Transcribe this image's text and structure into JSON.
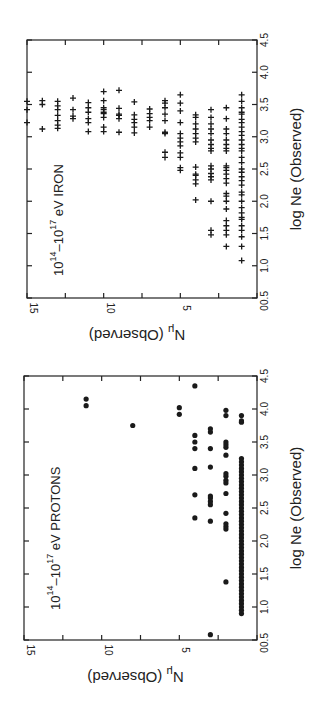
{
  "chart_data": [
    {
      "type": "scatter",
      "panel": "top",
      "title": "10^14 - 10^17 eV IRON",
      "title_parts": {
        "base1": "10",
        "exp1": "14",
        "dash": "–",
        "base2": "10",
        "exp2": "17",
        "rest": " eV IRON"
      },
      "marker": "plus",
      "xlabel": "log Ne (Observed)",
      "ylabel": "N_mu (Observed)",
      "ylabel_parts": {
        "symbol": "N",
        "sub": "μ",
        "rest": " (Observed)"
      },
      "xlim": [
        0.5,
        4.5
      ],
      "ylim": [
        0,
        15
      ],
      "xticks": [
        "0.5",
        "1.0",
        "1.5",
        "2.0",
        "2.5",
        "3.0",
        "3.5",
        "4.0",
        "4.5"
      ],
      "yticks": [
        "0",
        "5",
        "10",
        "15"
      ],
      "orientation": "rotated 90° clockwise",
      "series": [
        {
          "name": "Iron",
          "points": [
            {
              "n_mu": 15,
              "log_ne": [
                3.22,
                3.42,
                3.55
              ]
            },
            {
              "n_mu": 14,
              "log_ne": [
                3.12,
                3.5,
                3.56
              ]
            },
            {
              "n_mu": 13,
              "log_ne": [
                3.13,
                3.18,
                3.25,
                3.33,
                3.42,
                3.48,
                3.55
              ]
            },
            {
              "n_mu": 12,
              "log_ne": [
                3.28,
                3.32,
                3.42,
                3.6
              ]
            },
            {
              "n_mu": 11,
              "log_ne": [
                3.08,
                3.22,
                3.28,
                3.38,
                3.45,
                3.53
              ]
            },
            {
              "n_mu": 10,
              "log_ne": [
                3.08,
                3.15,
                3.3,
                3.36,
                3.38,
                3.42,
                3.45,
                3.56,
                3.7
              ]
            },
            {
              "n_mu": 9,
              "log_ne": [
                3.07,
                3.28,
                3.33,
                3.35,
                3.44,
                3.72
              ]
            },
            {
              "n_mu": 8,
              "log_ne": [
                3.06,
                3.15,
                3.22,
                3.27,
                3.34,
                3.54
              ]
            },
            {
              "n_mu": 7,
              "log_ne": [
                3.15,
                3.25,
                3.3,
                3.36,
                3.43
              ]
            },
            {
              "n_mu": 6,
              "log_ne": [
                2.68,
                2.76,
                3.05,
                3.07,
                3.25,
                3.35,
                3.45,
                3.52,
                3.56
              ]
            },
            {
              "n_mu": 5,
              "log_ne": [
                2.48,
                2.52,
                2.68,
                2.75,
                2.86,
                2.92,
                2.98,
                3.05,
                3.22,
                3.4,
                3.52,
                3.65
              ]
            },
            {
              "n_mu": 4,
              "log_ne": [
                2.02,
                2.27,
                2.33,
                2.4,
                2.42,
                2.53,
                2.92,
                2.98,
                3.05,
                3.12,
                3.2,
                3.3,
                3.34
              ]
            },
            {
              "n_mu": 3,
              "log_ne": [
                1.48,
                1.55,
                2.0,
                2.33,
                2.38,
                2.43,
                2.5,
                2.55,
                2.78,
                2.82,
                2.88,
                2.95,
                3.05,
                3.12,
                3.2,
                3.3,
                3.42
              ]
            },
            {
              "n_mu": 2,
              "log_ne": [
                1.3,
                1.48,
                1.55,
                1.62,
                1.7,
                1.88,
                2.0,
                2.08,
                2.12,
                2.28,
                2.35,
                2.42,
                2.48,
                2.52,
                2.55,
                2.78,
                2.82,
                2.88,
                2.95,
                3.05,
                3.12,
                3.28,
                3.45
              ]
            },
            {
              "n_mu": 1,
              "log_ne": [
                1.08,
                1.3,
                1.45,
                1.55,
                1.62,
                1.72,
                1.75,
                1.82,
                1.9,
                2.0,
                2.1,
                2.14,
                2.25,
                2.32,
                2.38,
                2.45,
                2.5,
                2.6,
                2.68,
                2.78,
                2.82,
                2.88,
                2.95,
                3.02,
                3.08,
                3.15,
                3.22,
                3.27,
                3.35,
                3.38,
                3.45,
                3.55,
                3.65
              ]
            }
          ]
        }
      ]
    },
    {
      "type": "scatter",
      "panel": "bottom",
      "title": "10^14 - 10^17 eV PROTONS",
      "title_parts": {
        "base1": "10",
        "exp1": "14",
        "dash": "–",
        "base2": "10",
        "exp2": "17",
        "rest": " eV  PROTONS"
      },
      "marker": "dot",
      "xlabel": "log Ne (Observed)",
      "ylabel": "N_mu (Observed)",
      "ylabel_parts": {
        "symbol": "N",
        "sub": "μ",
        "rest": " (Observed)"
      },
      "xlim": [
        0.5,
        4.5
      ],
      "ylim": [
        0,
        15
      ],
      "xticks": [
        "0.5",
        "1.0",
        "1.5",
        "2.0",
        "2.5",
        "3.0",
        "3.5",
        "4.0",
        "4.5"
      ],
      "yticks": [
        "0",
        "5",
        "10",
        "15"
      ],
      "orientation": "rotated 90° clockwise",
      "series": [
        {
          "name": "Protons",
          "points": [
            {
              "n_mu": 11,
              "log_ne": [
                4.05,
                4.15
              ]
            },
            {
              "n_mu": 8,
              "log_ne": [
                3.75
              ]
            },
            {
              "n_mu": 5,
              "log_ne": [
                3.92,
                4.02
              ]
            },
            {
              "n_mu": 4,
              "log_ne": [
                2.35,
                2.7,
                3.1,
                3.4,
                3.5,
                3.6,
                4.35
              ]
            },
            {
              "n_mu": 3,
              "log_ne": [
                0.58,
                2.3,
                2.55,
                2.6,
                2.65,
                2.68,
                3.12,
                3.4,
                3.65,
                3.7
              ]
            },
            {
              "n_mu": 2,
              "log_ne": [
                1.38,
                2.18,
                2.22,
                2.26,
                2.42,
                2.72,
                2.88,
                2.92,
                2.98,
                3.02,
                3.3,
                3.42,
                3.46,
                3.5,
                3.9,
                3.98
              ]
            },
            {
              "n_mu": 1,
              "log_ne_range": [
                0.9,
                3.25
              ],
              "log_ne_extra": [
                3.8,
                3.82,
                3.9
              ]
            }
          ]
        }
      ]
    }
  ]
}
